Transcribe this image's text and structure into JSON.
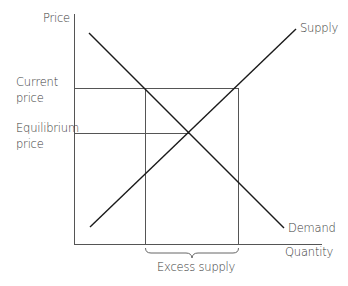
{
  "diagram": {
    "axes": {
      "y_label": "Price",
      "x_label": "Quantity"
    },
    "price_labels": {
      "current_line1": "Current",
      "current_line2": "price",
      "equilibrium_line1": "Equilibrium",
      "equilibrium_line2": "price"
    },
    "curves": {
      "supply_label": "Supply",
      "demand_label": "Demand"
    },
    "annotation": {
      "excess_label": "Excess supply"
    },
    "colors": {
      "curve": "#1a1a1a",
      "guide": "#555555",
      "axis": "#555555",
      "text": "#3a3a3a"
    }
  }
}
